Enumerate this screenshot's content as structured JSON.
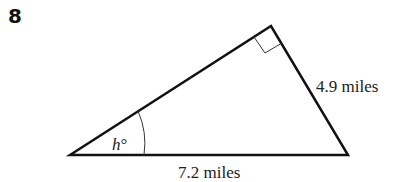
{
  "problem": {
    "number": "8"
  },
  "diagram": {
    "type": "right-triangle",
    "vertices": {
      "left": [
        70,
        155
      ],
      "top": [
        271,
        26
      ],
      "right": [
        348,
        155
      ]
    },
    "right_angle_at": "top",
    "labels": {
      "hypotenuse": "7.2 miles",
      "right_leg": "4.9 miles",
      "angle_var": "h",
      "angle_unit": "°"
    },
    "stroke_color": "#111111"
  }
}
